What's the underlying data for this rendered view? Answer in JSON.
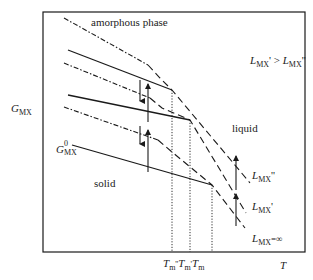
{
  "diagram": {
    "axes": {
      "y_label_main": "G",
      "y_label_sub": "MX",
      "x_label": "T"
    },
    "phase_labels": {
      "amorphous": "amorphous phase",
      "liquid": "liquid",
      "solid": "solid"
    },
    "relation": {
      "lhs_main": "L",
      "lhs_sub": "MX",
      "lhs_prime": "'",
      "op": " > ",
      "rhs_main": "L",
      "rhs_sub": "MX",
      "rhs_prime": "''"
    },
    "g0_label": {
      "main": "G",
      "sup": "0",
      "sub": "MX"
    },
    "liquid_curves": [
      {
        "main": "L",
        "sub": "MX",
        "suffix": "''"
      },
      {
        "main": "L",
        "sub": "MX",
        "suffix": "'"
      },
      {
        "main": "L",
        "sub": "MX",
        "suffix": "=∞"
      }
    ],
    "melting_temps": [
      {
        "main": "T",
        "sub": "m",
        "suffix": "''"
      },
      {
        "main": "T",
        "sub": "m",
        "suffix": "'"
      },
      {
        "main": "T",
        "sub": "m",
        "suffix": ""
      }
    ],
    "colors": {
      "line": "#1a1a1a",
      "background": "#ffffff"
    }
  }
}
